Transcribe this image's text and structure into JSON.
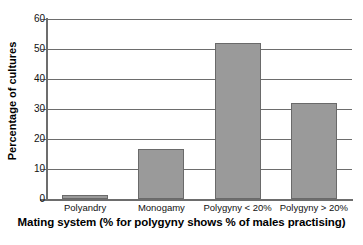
{
  "chart_data": {
    "type": "bar",
    "title": "",
    "xlabel": "Mating system (% for polygyny shows % of males practising)",
    "ylabel": "Percentage of cultures",
    "categories": [
      "Polyandry",
      "Monogamy",
      "Polygyny < 20%",
      "Polygyny > 20%"
    ],
    "values": [
      1.5,
      16.7,
      52,
      32
    ],
    "ylim": [
      0,
      60
    ],
    "yticks": [
      0,
      10,
      20,
      30,
      40,
      50,
      60
    ],
    "ytick_labels": [
      "0",
      "10",
      "20",
      "30",
      "40",
      "50",
      "60"
    ],
    "grid": true,
    "grid_axis": "y",
    "legend": false,
    "bar_color": "#9a9a9a",
    "bar_edge_color": "#6a6a6a",
    "axis_color": "#6d6d6d",
    "background_color": "#ffffff"
  }
}
